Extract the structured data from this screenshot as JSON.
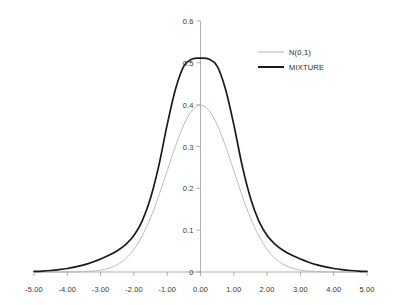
{
  "chart_data": {
    "type": "line",
    "title": "",
    "xlabel": "",
    "ylabel": "",
    "xlim": [
      -5,
      5
    ],
    "ylim": [
      0,
      0.6
    ],
    "grid": false,
    "legend_position": "upper-right",
    "x_tick_labels": [
      "-5.00",
      "-4.00",
      "-3.00",
      "-2.00",
      "-1.00",
      "0.00",
      "1.00",
      "2.00",
      "3.00",
      "4.00",
      "5.00"
    ],
    "x_tick_values": [
      -5,
      -4,
      -3,
      -2,
      -1,
      0,
      1,
      2,
      3,
      4,
      5
    ],
    "y_tick_labels": [
      "0",
      "0.1",
      "0.2",
      "0.3",
      "0.4",
      "0.5",
      "0.6"
    ],
    "y_tick_values": [
      0,
      0.1,
      0.2,
      0.3,
      0.4,
      0.5,
      0.6
    ],
    "colors": {
      "series_normal": "#b3b3b3",
      "series_mixture": "#1a1a1a",
      "axis": "#9a9a9a",
      "text": "#3a3a3a"
    },
    "series": [
      {
        "name": "N(0,1)",
        "color": "#b3b3b3",
        "width": 0.9,
        "x": [
          -5,
          -4.75,
          -4.5,
          -4.25,
          -4,
          -3.75,
          -3.5,
          -3.25,
          -3,
          -2.75,
          -2.5,
          -2.25,
          -2,
          -1.75,
          -1.5,
          -1.25,
          -1,
          -0.75,
          -0.5,
          -0.25,
          0,
          0.25,
          0.5,
          0.75,
          1,
          1.25,
          1.5,
          1.75,
          2,
          2.25,
          2.5,
          2.75,
          3,
          3.25,
          3.5,
          3.75,
          4,
          4.25,
          4.5,
          4.75,
          5
        ],
        "values": [
          1.5e-06,
          4.6e-06,
          1.6e-05,
          4.97e-05,
          0.0001338,
          0.0003374,
          0.0008727,
          0.002031,
          0.0044318,
          0.0090936,
          0.0175283,
          0.0316644,
          0.053991,
          0.0862773,
          0.1295176,
          0.1826491,
          0.2419707,
          0.3011374,
          0.3520653,
          0.3866681,
          0.3989423,
          0.3866681,
          0.3520653,
          0.3011374,
          0.2419707,
          0.1826491,
          0.1295176,
          0.0862773,
          0.053991,
          0.0316644,
          0.0175283,
          0.0090936,
          0.0044318,
          0.002031,
          0.0008727,
          0.0003374,
          0.0001338,
          4.97e-05,
          1.6e-05,
          4.6e-06,
          1.5e-06
        ]
      },
      {
        "name": "MIXTURE",
        "color": "#1a1a1a",
        "width": 1.7,
        "x": [
          -5,
          -4.75,
          -4.5,
          -4.25,
          -4,
          -3.75,
          -3.5,
          -3.25,
          -3,
          -2.75,
          -2.5,
          -2.25,
          -2,
          -1.75,
          -1.5,
          -1.25,
          -1,
          -0.75,
          -0.5,
          -0.25,
          0,
          0.25,
          0.5,
          0.75,
          1,
          1.25,
          1.5,
          1.75,
          2,
          2.25,
          2.5,
          2.75,
          3,
          3.25,
          3.5,
          3.75,
          4,
          4.25,
          4.5,
          4.75,
          5
        ],
        "values": [
          0.00139,
          0.00228,
          0.00363,
          0.0056,
          0.00837,
          0.01214,
          0.01708,
          0.02331,
          0.0309,
          0.03997,
          0.05098,
          0.06557,
          0.08733,
          0.12229,
          0.17706,
          0.25488,
          0.35221,
          0.43726,
          0.49215,
          0.509,
          0.5112,
          0.509,
          0.49215,
          0.43726,
          0.35221,
          0.25488,
          0.17706,
          0.12229,
          0.08733,
          0.06557,
          0.05098,
          0.03997,
          0.0309,
          0.02331,
          0.01708,
          0.01214,
          0.00837,
          0.0056,
          0.00363,
          0.00228,
          0.00139
        ]
      }
    ]
  },
  "legend": {
    "entries": [
      {
        "label": "N(0,1)"
      },
      {
        "label": "MIXTURE"
      }
    ]
  }
}
